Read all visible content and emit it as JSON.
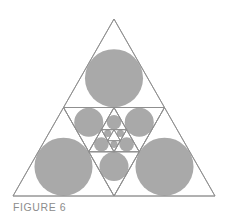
{
  "figure": {
    "caption": "FIGURE 6",
    "outer_triangle": {
      "apex": [
        114,
        19
      ],
      "bottom_left": [
        13,
        196
      ],
      "bottom_right": [
        215,
        196
      ]
    },
    "recursion_depth": 4,
    "colors": {
      "circle_fill": "#a9a9a9",
      "line": "#8e8e8e",
      "caption": "#8c8c8c",
      "background": "#ffffff"
    }
  }
}
